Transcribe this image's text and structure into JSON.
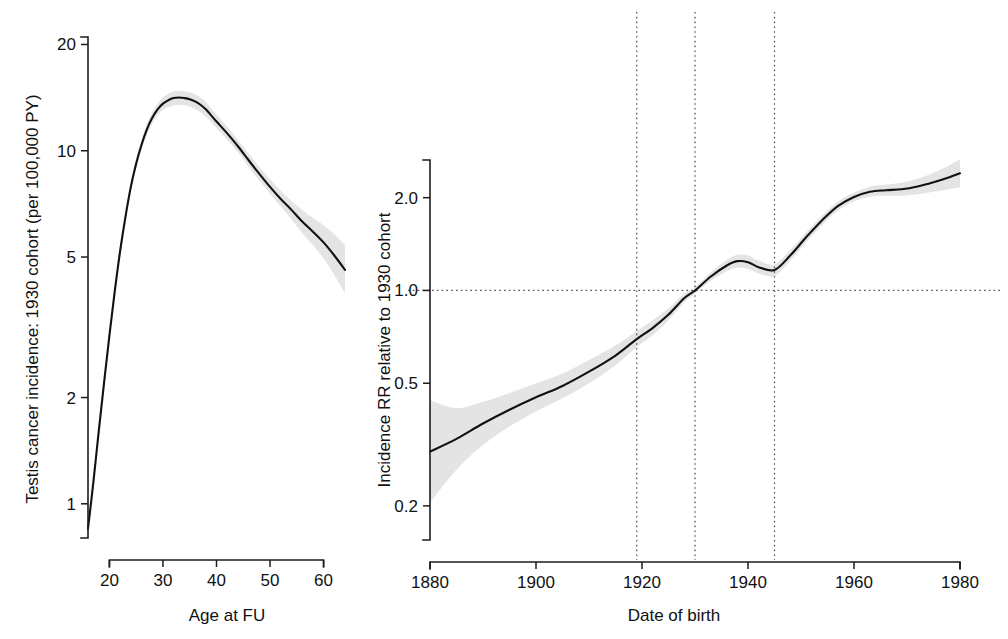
{
  "figure": {
    "background": "#ffffff",
    "line_color": "#111111",
    "band_color": "#d9d9d9",
    "reference_color": "#555555"
  },
  "chart_data": [
    {
      "type": "line",
      "panel": "left",
      "title": "",
      "xlabel": "Age at FU",
      "ylabel": "Testis cancer incidence: 1930 cohort (per 100,000 PY)",
      "xscale": "linear",
      "yscale": "log",
      "xlim": [
        16,
        64
      ],
      "ylim": [
        0.8,
        21
      ],
      "xticks": [
        20,
        30,
        40,
        50,
        60
      ],
      "xticklabels": [
        "20",
        "30",
        "40",
        "50",
        "60"
      ],
      "yticks": [
        1,
        2,
        5,
        10,
        20
      ],
      "yticklabels": [
        "1",
        "2",
        "5",
        "10",
        "20"
      ],
      "grid": false,
      "legend": "none",
      "series": [
        {
          "name": "Incidence rate (1930 cohort)",
          "x": [
            16,
            17,
            18,
            19,
            20,
            21,
            22,
            23,
            24,
            25,
            26,
            27,
            28,
            29,
            30,
            31,
            32,
            33,
            34,
            35,
            36,
            37,
            38,
            39,
            40,
            42,
            44,
            46,
            48,
            50,
            52,
            54,
            56,
            58,
            60,
            62,
            64
          ],
          "values": [
            0.85,
            1.15,
            1.6,
            2.2,
            3.0,
            4.0,
            5.2,
            6.5,
            7.9,
            9.2,
            10.4,
            11.5,
            12.4,
            13.1,
            13.6,
            13.9,
            14.1,
            14.15,
            14.1,
            14.0,
            13.8,
            13.5,
            13.1,
            12.6,
            12.1,
            11.2,
            10.3,
            9.4,
            8.6,
            7.9,
            7.3,
            6.8,
            6.3,
            5.9,
            5.5,
            5.05,
            4.6
          ],
          "ci_lower": [
            0.83,
            1.12,
            1.56,
            2.15,
            2.93,
            3.9,
            5.05,
            6.3,
            7.65,
            8.9,
            10.05,
            11.1,
            11.95,
            12.6,
            13.05,
            13.3,
            13.45,
            13.5,
            13.45,
            13.35,
            13.15,
            12.85,
            12.5,
            12.05,
            11.6,
            10.75,
            9.9,
            9.0,
            8.25,
            7.55,
            6.95,
            6.4,
            5.85,
            5.4,
            4.95,
            4.45,
            3.95
          ],
          "ci_upper": [
            0.87,
            1.18,
            1.64,
            2.26,
            3.08,
            4.1,
            5.35,
            6.7,
            8.15,
            9.5,
            10.75,
            11.9,
            12.85,
            13.6,
            14.15,
            14.5,
            14.75,
            14.8,
            14.75,
            14.65,
            14.45,
            14.15,
            13.75,
            13.2,
            12.65,
            11.7,
            10.75,
            9.8,
            9.0,
            8.3,
            7.7,
            7.2,
            6.8,
            6.45,
            6.15,
            5.8,
            5.4
          ]
        }
      ]
    },
    {
      "type": "line",
      "panel": "right",
      "title": "",
      "xlabel": "Date of birth",
      "ylabel": "Incidence RR relative to 1930 cohort",
      "xscale": "linear",
      "yscale": "log",
      "xlim": [
        1880,
        1980
      ],
      "ylim": [
        0.155,
        2.65
      ],
      "xticks": [
        1880,
        1900,
        1920,
        1940,
        1960,
        1980
      ],
      "xticklabels": [
        "1880",
        "1900",
        "1920",
        "1940",
        "1960",
        "1980"
      ],
      "yticks": [
        0.2,
        0.5,
        1.0,
        2.0
      ],
      "yticklabels": [
        "0.2",
        "0.5",
        "1.0",
        "2.0"
      ],
      "grid": false,
      "legend": "none",
      "reference_lines": {
        "horizontal": [
          1.0
        ],
        "vertical": [
          1919,
          1930,
          1945
        ]
      },
      "series": [
        {
          "name": "Incidence rate ratio vs 1930 birth cohort",
          "x": [
            1880,
            1885,
            1890,
            1895,
            1900,
            1905,
            1910,
            1915,
            1919,
            1922,
            1925,
            1928,
            1930,
            1933,
            1936,
            1938,
            1940,
            1942,
            1945,
            1948,
            1951,
            1954,
            1957,
            1960,
            1963,
            1966,
            1969,
            1972,
            1975,
            1978,
            1980
          ],
          "values": [
            0.3,
            0.33,
            0.37,
            0.41,
            0.45,
            0.49,
            0.545,
            0.615,
            0.695,
            0.755,
            0.835,
            0.945,
            1.0,
            1.11,
            1.205,
            1.245,
            1.235,
            1.19,
            1.165,
            1.3,
            1.49,
            1.69,
            1.88,
            2.01,
            2.09,
            2.115,
            2.13,
            2.175,
            2.245,
            2.33,
            2.4
          ],
          "ci_lower": [
            0.205,
            0.262,
            0.315,
            0.362,
            0.405,
            0.447,
            0.5,
            0.572,
            0.655,
            0.715,
            0.8,
            0.915,
            0.975,
            1.075,
            1.155,
            1.185,
            1.175,
            1.135,
            1.115,
            1.25,
            1.435,
            1.63,
            1.82,
            1.945,
            2.015,
            2.03,
            2.03,
            2.05,
            2.09,
            2.13,
            2.16
          ],
          "ci_upper": [
            0.44,
            0.415,
            0.435,
            0.465,
            0.5,
            0.538,
            0.595,
            0.663,
            0.738,
            0.8,
            0.875,
            0.978,
            1.025,
            1.145,
            1.255,
            1.305,
            1.3,
            1.25,
            1.215,
            1.355,
            1.545,
            1.75,
            1.945,
            2.075,
            2.17,
            2.205,
            2.235,
            2.305,
            2.41,
            2.55,
            2.665
          ]
        }
      ]
    }
  ],
  "left_panel": {
    "y_axis_title": "Testis cancer incidence: 1930 cohort (per 100,000 PY)",
    "x_axis_title": "Age at FU",
    "y_tick_labels": [
      "20",
      "10",
      "5",
      "2",
      "1"
    ],
    "x_tick_labels": [
      "20",
      "30",
      "40",
      "50",
      "60"
    ]
  },
  "right_panel": {
    "y_axis_title": "Incidence RR relative to 1930 cohort",
    "x_axis_title": "Date of birth",
    "y_tick_labels": [
      "2.0",
      "1.0",
      "0.5",
      "0.2"
    ],
    "x_tick_labels": [
      "1880",
      "1900",
      "1920",
      "1940",
      "1960",
      "1980"
    ]
  }
}
